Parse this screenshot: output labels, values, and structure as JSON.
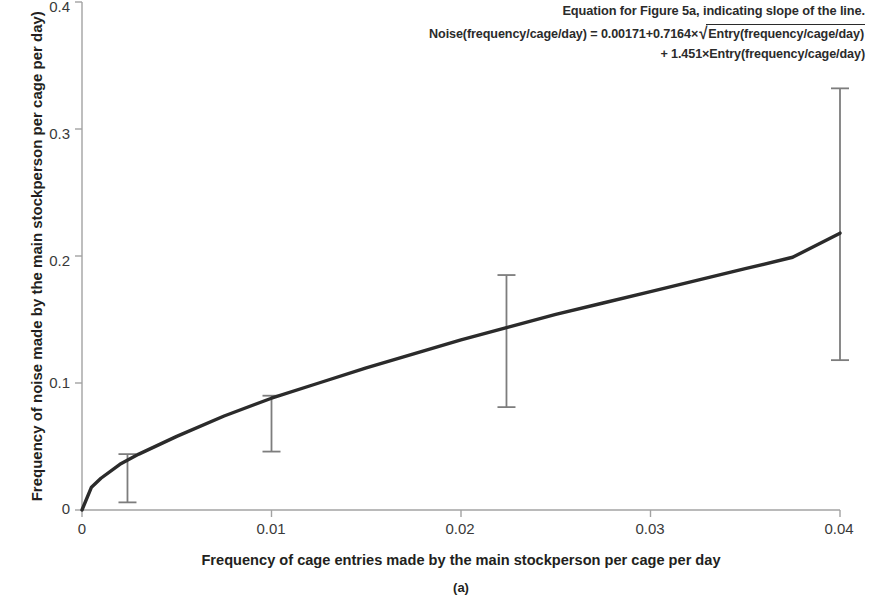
{
  "annotation": {
    "heading": "Equation for Figure 5a, indicating slope of the line.",
    "equation_line1_prefix": "Noise(frequency/cage/day) = 0.00171+0.7164×",
    "equation_sqrt_symbol": "√",
    "equation_radicand": "Entry(frequency/cage/day)",
    "equation_line2": "+ 1.451×Entry(frequency/cage/day)"
  },
  "caption": "(a)",
  "chart_data": {
    "type": "line",
    "title": "",
    "subtitle": "",
    "xlabel": "Frequency of cage entries made by the main stockperson per cage per day",
    "ylabel": "Frequency of noise made by the main stockperson per cage per day)",
    "xlim": [
      0,
      0.04
    ],
    "ylim": [
      0,
      0.4
    ],
    "xticks": [
      0,
      0.01,
      0.02,
      0.03,
      0.04
    ],
    "xtick_labels": [
      "0",
      "0.01",
      "0.02",
      "0.03",
      "0.04"
    ],
    "yticks": [
      0,
      0.1,
      0.2,
      0.3,
      0.4
    ],
    "ytick_labels": [
      "0",
      "0.1",
      "0.2",
      "0.3",
      "0.4"
    ],
    "grid": false,
    "legend": "none",
    "fit_equation": "Noise = 0.00171 + 0.7164*sqrt(Entry) + 1.451*Entry",
    "coefficients": {
      "intercept": 0.00171,
      "sqrt_term": 0.7164,
      "linear_term": 1.451
    },
    "series": [
      {
        "name": "Fitted curve",
        "x": [
          0,
          0.0005,
          0.001,
          0.002,
          0.003,
          0.005,
          0.0075,
          0.01,
          0.0125,
          0.015,
          0.0175,
          0.02,
          0.0225,
          0.025,
          0.0275,
          0.03,
          0.0325,
          0.035,
          0.0375,
          0.04
        ],
        "y": [
          0.0,
          0.018,
          0.025,
          0.036,
          0.044,
          0.058,
          0.074,
          0.088,
          0.1,
          0.112,
          0.123,
          0.134,
          0.144,
          0.154,
          0.163,
          0.172,
          0.181,
          0.19,
          0.199,
          0.218
        ]
      }
    ],
    "error_bars": [
      {
        "x": 0.0024,
        "y": 0.036,
        "lower": 0.006,
        "upper": 0.044
      },
      {
        "x": 0.01,
        "y": 0.066,
        "lower": 0.046,
        "upper": 0.09
      },
      {
        "x": 0.0224,
        "y": 0.131,
        "lower": 0.081,
        "upper": 0.185
      },
      {
        "x": 0.04,
        "y": 0.218,
        "lower": 0.118,
        "upper": 0.332
      }
    ]
  },
  "colors": {
    "curve": "#2b2b2b",
    "axis": "#9c9c9c",
    "error_bar": "#7d7d7d",
    "text": "#231f20"
  }
}
